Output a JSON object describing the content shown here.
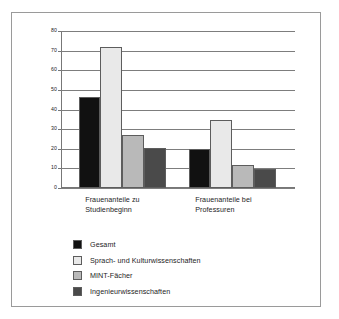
{
  "chart_data": {
    "type": "bar",
    "title": "",
    "xlabel": "",
    "ylabel": "",
    "ylim": [
      0,
      80
    ],
    "yticks": [
      0,
      10,
      20,
      30,
      40,
      50,
      60,
      70,
      80
    ],
    "ytick_labels": [
      "0",
      "10",
      "20",
      "30",
      "40",
      "50",
      "60",
      "70",
      "80"
    ],
    "grid": true,
    "legend_position": "below",
    "categories": [
      "Frauenanteile zu\nStudienbeginn",
      "Frauenanteile bei\nProfessuren"
    ],
    "series": [
      {
        "name": "Gesamt",
        "color": "#111111",
        "values": [
          46.5,
          20
        ]
      },
      {
        "name": "Sprach- und Kulturwissenschaften",
        "color": "#e9e9e9",
        "values": [
          72,
          34.5
        ]
      },
      {
        "name": "MINT-Fächer",
        "color": "#b9b9b9",
        "values": [
          27,
          11.5
        ]
      },
      {
        "name": "Ingenieurwissenschaften",
        "color": "#4a4a4a",
        "values": [
          20.5,
          9.5
        ]
      }
    ]
  },
  "style": {
    "frame_color": "#9a9a9a",
    "axis_color": "#777777",
    "grid_color": "#7d7d7d",
    "bar_edge_color": "#5d5d5d",
    "text_color": "#1d1d1d",
    "background": "#ffffff"
  }
}
